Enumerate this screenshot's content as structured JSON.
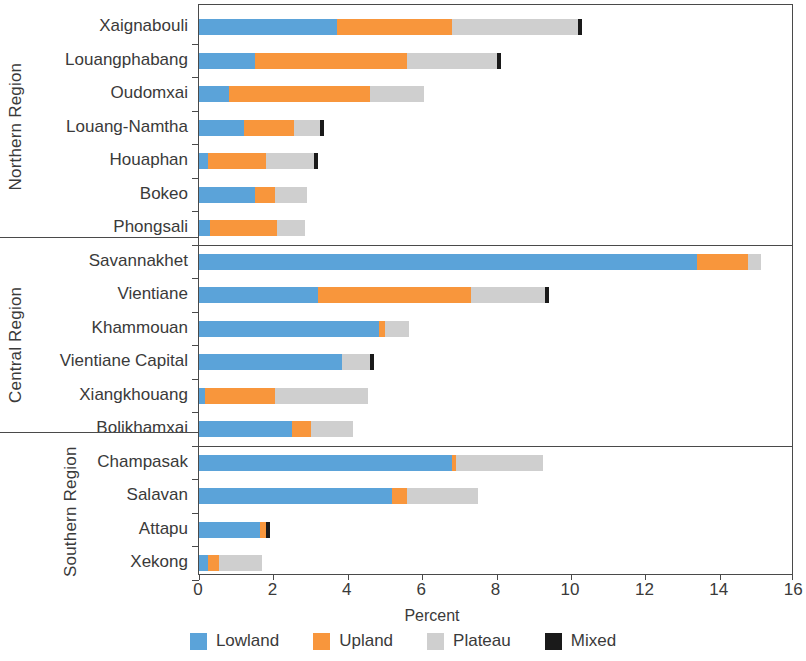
{
  "chart_data": {
    "type": "bar",
    "orientation": "horizontal",
    "stacked": true,
    "title": "",
    "xlabel": "Percent",
    "ylabel": "",
    "xlim": [
      0,
      16
    ],
    "xticks": [
      0,
      2,
      4,
      6,
      8,
      10,
      12,
      14,
      16
    ],
    "grid": false,
    "legend_position": "bottom",
    "legend": [
      "Lowland",
      "Upland",
      "Plateau",
      "Mixed"
    ],
    "series": [
      {
        "name": "Lowland",
        "color": "#5ba3d9",
        "values": [
          3.7,
          1.5,
          0.8,
          1.2,
          0.25,
          1.5,
          0.3,
          13.4,
          3.2,
          4.85,
          3.85,
          0.15,
          2.5,
          6.8,
          5.2,
          1.65,
          0.25
        ]
      },
      {
        "name": "Upland",
        "color": "#f8963c",
        "values": [
          3.1,
          4.1,
          3.8,
          1.35,
          1.55,
          0.55,
          1.8,
          1.35,
          4.1,
          0.15,
          0.0,
          1.9,
          0.5,
          0.1,
          0.4,
          0.15,
          0.3
        ]
      },
      {
        "name": "Plateau",
        "color": "#cfcfcf",
        "values": [
          3.4,
          2.4,
          1.45,
          0.7,
          1.3,
          0.85,
          0.75,
          0.35,
          2.0,
          0.65,
          0.75,
          2.5,
          1.15,
          2.35,
          1.9,
          0.0,
          1.15
        ]
      },
      {
        "name": "Mixed",
        "color": "#1a1a1a",
        "values": [
          0.1,
          0.1,
          0.0,
          0.1,
          0.1,
          0.0,
          0.0,
          0.0,
          0.1,
          0.0,
          0.1,
          0.0,
          0.0,
          0.0,
          0.0,
          0.1,
          0.0
        ]
      }
    ],
    "categories": [
      "Xaignabouli",
      "Louangphabang",
      "Oudomxai",
      "Louang-Namtha",
      "Houaphan",
      "Bokeo",
      "Phongsali",
      "Savannakhet",
      "Vientiane",
      "Khammouan",
      "Vientiane Capital",
      "Xiangkhouang",
      "Bolikhamxai",
      "Champasak",
      "Salavan",
      "Attapu",
      "Xekong"
    ],
    "groups": [
      {
        "label": "Northern Region",
        "two_line": false,
        "start": 0,
        "count": 7
      },
      {
        "label": "Central Region",
        "two_line": false,
        "start": 7,
        "count": 6
      },
      {
        "label": "Southern Region",
        "two_line": true,
        "start": 13,
        "count": 4
      }
    ]
  },
  "axis": {
    "x_title": "Percent",
    "tick_labels": [
      "0",
      "2",
      "4",
      "6",
      "8",
      "10",
      "12",
      "14",
      "16"
    ]
  },
  "legend": {
    "items": [
      {
        "label": "Lowland",
        "color": "#5ba3d9",
        "icon": "square-swatch-icon"
      },
      {
        "label": "Upland",
        "color": "#f8963c",
        "icon": "square-swatch-icon"
      },
      {
        "label": "Plateau",
        "color": "#cfcfcf",
        "icon": "square-swatch-icon"
      },
      {
        "label": "Mixed",
        "color": "#1a1a1a",
        "icon": "square-swatch-icon"
      }
    ]
  }
}
